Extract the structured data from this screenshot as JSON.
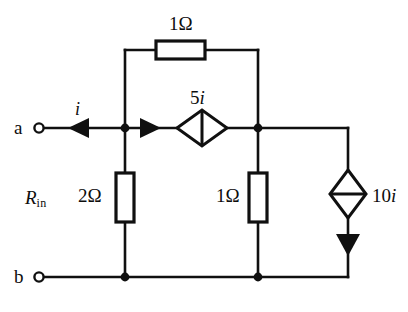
{
  "diagram": {
    "type": "circuit-schematic",
    "colors": {
      "wire": "#101010",
      "background": "#ffffff",
      "text": "#0d0d0d"
    }
  },
  "terminals": {
    "top": "a",
    "bottom": "b"
  },
  "labels": {
    "input_resistance": "R",
    "input_resistance_sub": "in",
    "source_current": "i"
  },
  "components": {
    "r_top": {
      "value": "1Ω",
      "orientation": "horizontal"
    },
    "r_left": {
      "value": "2Ω",
      "orientation": "vertical"
    },
    "r_middle": {
      "value": "1Ω",
      "orientation": "vertical"
    },
    "ccvs_5i": {
      "value_prefix": "5",
      "value_var": "i",
      "label": "5i",
      "orientation": "horizontal",
      "arrow": "left"
    },
    "cccs_10i": {
      "value_prefix": "10",
      "value_var": "i",
      "label": "10i",
      "orientation": "vertical",
      "arrow": "down"
    }
  },
  "nodes": [
    {
      "name": "node-left-top",
      "x": 125,
      "y": 128
    },
    {
      "name": "node-right-top",
      "x": 258,
      "y": 128
    },
    {
      "name": "node-left-bottom",
      "x": 125,
      "y": 277
    },
    {
      "name": "node-right-bottom",
      "x": 258,
      "y": 277
    }
  ]
}
